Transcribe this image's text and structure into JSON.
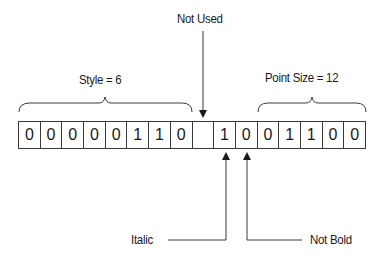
{
  "diagram": {
    "bits": [
      "0",
      "0",
      "0",
      "0",
      "0",
      "1",
      "1",
      "0",
      "",
      "1",
      "0",
      "0",
      "1",
      "1",
      "0",
      "0"
    ],
    "groups": [
      {
        "label": "Style = 6",
        "start_bit": 0,
        "end_bit": 7
      },
      {
        "label": "Point Size = 12",
        "start_bit": 10,
        "end_bit": 15
      }
    ],
    "annotations": {
      "not_used": {
        "label": "Not Used",
        "bit_index": 8
      },
      "italic": {
        "label": "Italic",
        "bit_index": 9
      },
      "not_bold": {
        "label": "Not Bold",
        "bit_index": 10
      }
    },
    "colors": {
      "line": "#3a3a3a",
      "text": "#1a1a1a",
      "background": "#ffffff"
    }
  }
}
